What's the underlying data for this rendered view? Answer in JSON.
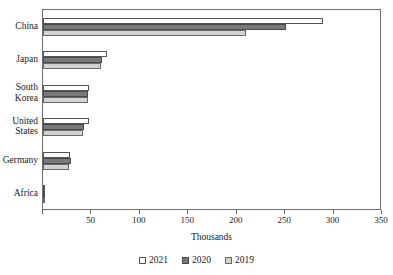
{
  "chart_data": {
    "type": "bar",
    "orientation": "horizontal",
    "title": "",
    "xlabel": "Thousands",
    "ylabel": "",
    "xlim": [
      0,
      350
    ],
    "xticks": [
      0,
      50,
      100,
      150,
      200,
      250,
      300,
      350
    ],
    "xtick_labels": [
      "",
      "50",
      "100",
      "150",
      "200",
      "250",
      "300",
      "350"
    ],
    "grid": false,
    "legend_position": "bottom",
    "categories": [
      "China",
      "Japan",
      "South\nKorea",
      "United\nStates",
      "Germany",
      "Africa"
    ],
    "series": [
      {
        "name": "2021",
        "color": "#ffffff",
        "values": [
          289,
          66,
          48,
          47,
          28,
          2
        ]
      },
      {
        "name": "2020",
        "color": "#787878",
        "values": [
          251,
          61,
          46,
          42,
          29,
          2
        ]
      },
      {
        "name": "2019",
        "color": "#d2d2d2",
        "values": [
          210,
          60,
          46,
          41,
          27,
          2
        ]
      }
    ]
  },
  "axis": {
    "x_title": "Thousands",
    "tick_0": "",
    "tick_50": "50",
    "tick_100": "100",
    "tick_150": "150",
    "tick_200": "200",
    "tick_250": "250",
    "tick_300": "300",
    "tick_350": "350"
  },
  "categories": {
    "china": "China",
    "japan": "Japan",
    "south_korea": "South\nKorea",
    "united_states": "United\nStates",
    "germany": "Germany",
    "africa": "Africa"
  },
  "legend": {
    "items": [
      {
        "label": "2021",
        "color": "#ffffff"
      },
      {
        "label": "2020",
        "color": "#787878"
      },
      {
        "label": "2019",
        "color": "#d2d2d2"
      }
    ]
  }
}
